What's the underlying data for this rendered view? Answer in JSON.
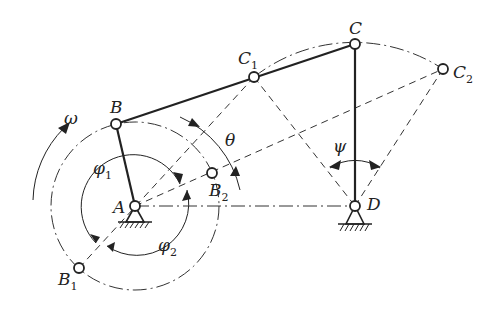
{
  "points": {
    "A": {
      "label": "A",
      "x": 135,
      "y": 206
    },
    "B": {
      "label": "B",
      "x": 116,
      "y": 124
    },
    "B1": {
      "label": "B",
      "sub": "1",
      "x": 79,
      "y": 268
    },
    "B2": {
      "label": "B",
      "sub": "2",
      "x": 212,
      "y": 173
    },
    "C": {
      "label": "C",
      "x": 355,
      "y": 44
    },
    "C1": {
      "label": "C",
      "sub": "1",
      "x": 254,
      "y": 77
    },
    "C2": {
      "label": "C",
      "sub": "2",
      "x": 443,
      "y": 69
    },
    "D": {
      "label": "D",
      "x": 355,
      "y": 206
    }
  },
  "labels": {
    "A": "A",
    "B": "B",
    "B1_main": "B",
    "B1_sub": "1",
    "B2_main": "B",
    "B2_sub": "2",
    "C": "C",
    "C1_main": "C",
    "C1_sub": "1",
    "C2_main": "C",
    "C2_sub": "2",
    "D": "D",
    "omega": "ω",
    "theta": "θ",
    "psi": "ψ",
    "phi1_main": "φ",
    "phi1_sub": "1",
    "phi2_main": "φ",
    "phi2_sub": "2"
  },
  "colors": {
    "ink": "#222222",
    "background": "#ffffff"
  }
}
